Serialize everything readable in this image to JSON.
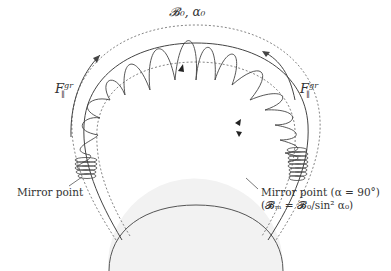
{
  "diagram": {
    "title_label": "𝓑₀, α₀",
    "force_label_left": {
      "base": "F",
      "sub": "∥",
      "sup": "gr"
    },
    "force_label_right": {
      "base": "F",
      "sub": "∥",
      "sup": "gr"
    },
    "mirror_point_left": "Mirror point",
    "mirror_point_right": "Mirror point (α = 90°)",
    "mirror_point_right_formula": "(𝓑ₘ = 𝓑₀/sin² α₀)",
    "colors": {
      "line": "#444444",
      "dotted": "#777777",
      "planet_fill": "#f2f2f2",
      "background": "#ffffff"
    },
    "elements": [
      "magnetic field line (solid arch)",
      "flux tube boundaries (dotted arches)",
      "particle helical trajectory",
      "planet (half disc)",
      "curved force arrows",
      "mirror point leader lines"
    ]
  }
}
